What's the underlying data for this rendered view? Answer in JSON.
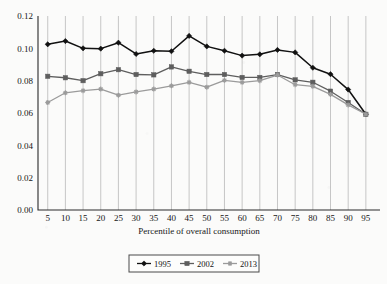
{
  "chart_data": {
    "type": "line",
    "title": "",
    "xlabel": "Percentile of overall consumption",
    "ylabel": "",
    "categories": [
      5,
      10,
      15,
      20,
      25,
      30,
      35,
      40,
      45,
      50,
      55,
      60,
      65,
      70,
      75,
      80,
      85,
      90,
      95
    ],
    "x_tick_labels": [
      "5",
      "10",
      "15",
      "20",
      "25",
      "30",
      "35",
      "40",
      "45",
      "50",
      "55",
      "60",
      "65",
      "70",
      "75",
      "80",
      "85",
      "90",
      "95"
    ],
    "y_tick_labels": [
      "0.00",
      "0.02",
      "0.04",
      "0.06",
      "0.08",
      "0.10",
      "0.12"
    ],
    "y_ticks": [
      0.0,
      0.02,
      0.04,
      0.06,
      0.08,
      0.1,
      0.12
    ],
    "ylim": [
      0,
      0.12
    ],
    "xlim": [
      5,
      95
    ],
    "grid": "vertical",
    "legend_position": "bottom",
    "series": [
      {
        "name": "1995",
        "color": "#111111",
        "marker": "diamond",
        "values": [
          0.1025,
          0.1045,
          0.1,
          0.0998,
          0.1035,
          0.0965,
          0.0985,
          0.0982,
          0.1077,
          0.1012,
          0.0985,
          0.0955,
          0.0963,
          0.099,
          0.0975,
          0.088,
          0.084,
          0.0745,
          0.0592
        ]
      },
      {
        "name": "2002",
        "color": "#5e5e5e",
        "marker": "square",
        "values": [
          0.0827,
          0.0818,
          0.08,
          0.0843,
          0.0868,
          0.0838,
          0.0836,
          0.0885,
          0.0858,
          0.0838,
          0.0838,
          0.082,
          0.082,
          0.0838,
          0.0805,
          0.079,
          0.0735,
          0.0665,
          0.0592
        ]
      },
      {
        "name": "2013",
        "color": "#9b9b9b",
        "marker": "star",
        "values": [
          0.0665,
          0.0725,
          0.0738,
          0.0748,
          0.071,
          0.073,
          0.0748,
          0.0768,
          0.079,
          0.076,
          0.0802,
          0.079,
          0.08,
          0.0835,
          0.0775,
          0.0765,
          0.0715,
          0.065,
          0.0592
        ]
      }
    ]
  },
  "legend": {
    "entries": [
      {
        "label": "1995"
      },
      {
        "label": "2002"
      },
      {
        "label": "2013"
      }
    ]
  }
}
